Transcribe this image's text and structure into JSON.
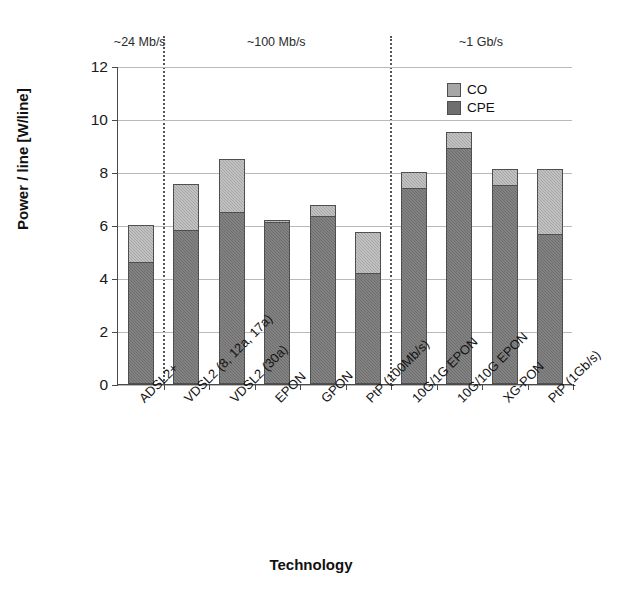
{
  "chart_data": {
    "type": "bar",
    "stacked": true,
    "title": "",
    "xlabel": "Technology",
    "ylabel": "Power / line [W/line]",
    "ylim": [
      0,
      12
    ],
    "yticks": [
      0,
      2,
      4,
      6,
      8,
      10,
      12
    ],
    "grid": true,
    "legend_position": "top-right",
    "categories": [
      "ADSL2+",
      "VDSL2 (8, 12a, 17a)",
      "VDSL2 (30a)",
      "EPON",
      "GPON",
      "PtP (100Mb/s)",
      "10G/1G EPON",
      "10G/10G EPON",
      "XG-PON",
      "PtP (1Gb/s)"
    ],
    "series": [
      {
        "name": "CPE",
        "color": "#6e6e6e",
        "values": [
          4.6,
          5.8,
          6.5,
          6.1,
          6.35,
          4.2,
          7.4,
          8.9,
          7.5,
          5.65
        ]
      },
      {
        "name": "CO",
        "color": "#a6a6a6",
        "values": [
          1.4,
          1.75,
          2.0,
          0.1,
          0.4,
          1.55,
          0.6,
          0.6,
          0.6,
          2.45
        ]
      }
    ],
    "totals": [
      6.0,
      7.55,
      8.5,
      6.2,
      6.75,
      5.75,
      8.0,
      9.5,
      8.1,
      8.1
    ],
    "group_annotations": [
      {
        "label": "~24 Mb/s",
        "categories": [
          "ADSL2+"
        ]
      },
      {
        "label": "~100 Mb/s",
        "categories": [
          "VDSL2 (8, 12a, 17a)",
          "VDSL2 (30a)",
          "EPON",
          "GPON",
          "PtP (100Mb/s)"
        ]
      },
      {
        "label": "~1 Gb/s",
        "categories": [
          "10G/1G EPON",
          "10G/10G EPON",
          "XG-PON",
          "PtP (1Gb/s)"
        ]
      }
    ],
    "dividers": 2
  },
  "legend": {
    "items": [
      {
        "label": "CO",
        "color": "#a6a6a6"
      },
      {
        "label": "CPE",
        "color": "#6e6e6e"
      }
    ]
  }
}
